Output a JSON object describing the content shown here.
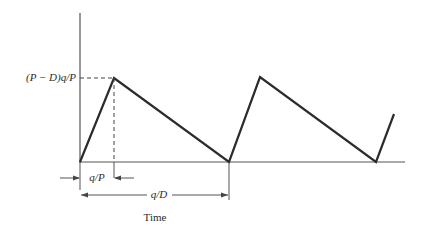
{
  "diagram": {
    "type": "inventory-sawtooth",
    "y_label": "(P − D)q/P",
    "x_axis_label": "Time",
    "dimension_short": "q/P",
    "dimension_long": "q/D"
  },
  "geometry": {
    "origin": [
      80,
      162
    ],
    "y_axis_top": 13,
    "x_axis_right": 405,
    "polyline": [
      [
        80,
        162
      ],
      [
        114,
        78
      ],
      [
        229,
        162
      ],
      [
        260,
        77
      ],
      [
        376,
        162
      ],
      [
        394,
        114
      ]
    ],
    "peak_level_y": 78,
    "peak1_x": 114
  },
  "colors": {
    "line": "#2b2b2b",
    "axis": "#555555",
    "text": "#2a2a2a"
  }
}
